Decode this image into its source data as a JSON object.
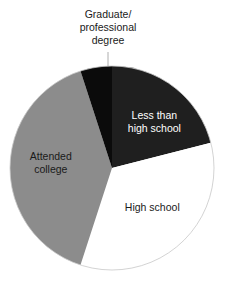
{
  "chart_data": {
    "type": "pie",
    "title": "",
    "categories": [
      "Less than high school",
      "High school",
      "Attended college",
      "Graduate/professional degree"
    ],
    "values": [
      21,
      34,
      40,
      5
    ],
    "unit": "percent (estimated from slice angles)",
    "start_angle_deg": 0,
    "direction": "clockwise",
    "colors": [
      "#1f1f1f",
      "#ffffff",
      "#8c8c8c",
      "#0b0b0b"
    ],
    "labels": [
      {
        "lines": [
          "Less than",
          "high school"
        ],
        "color": "#ffffff",
        "position": "inside"
      },
      {
        "lines": [
          "High school"
        ],
        "color": "#1a1a1a",
        "position": "inside"
      },
      {
        "lines": [
          "Attended",
          "college"
        ],
        "color": "#1a1a1a",
        "position": "inside"
      },
      {
        "lines": [
          "Graduate/",
          "professional",
          "degree"
        ],
        "color": "#1a1a1a",
        "position": "outside-top",
        "leader_line": true
      }
    ],
    "legend": null,
    "outline_color": "#c8c8c8"
  }
}
